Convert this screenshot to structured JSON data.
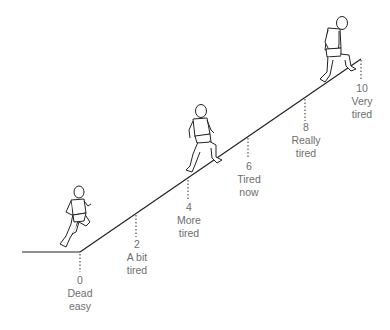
{
  "colors": {
    "line": "#222222",
    "label": "#6e6e6e",
    "background": "#ffffff"
  },
  "scale": [
    {
      "value": "0",
      "line1": "Dead",
      "line2": "easy"
    },
    {
      "value": "2",
      "line1": "A bit",
      "line2": "tired"
    },
    {
      "value": "4",
      "line1": "More",
      "line2": "tired"
    },
    {
      "value": "6",
      "line1": "Tired",
      "line2": "now"
    },
    {
      "value": "8",
      "line1": "Really",
      "line2": "tired"
    },
    {
      "value": "10",
      "line1": "Very",
      "line2": "tired"
    }
  ],
  "figures": [
    "running-figure",
    "climbing-figure",
    "tired-stepping-figure"
  ]
}
